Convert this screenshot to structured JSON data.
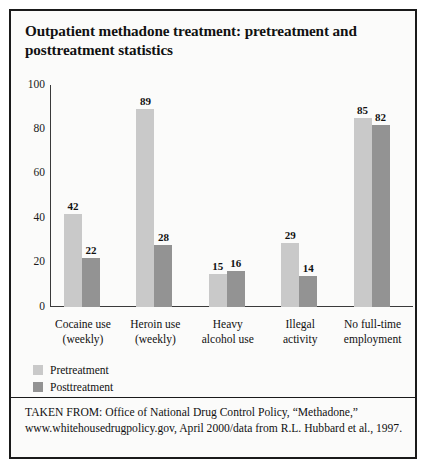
{
  "figure": {
    "title": "Outpatient methadone treatment: pretreatment and posttreatment statistics",
    "source": "TAKEN FROM: Office of National Drug Control Policy, “Methadone,” www.whitehousedrugpolicy.gov, April 2000/data from R.L. Hubbard et al., 1997."
  },
  "chart_data": {
    "type": "bar",
    "title": "Outpatient methadone treatment: pretreatment and posttreatment statistics",
    "xlabel": "",
    "ylabel": "",
    "ylim": [
      0,
      100
    ],
    "yticks": [
      "0",
      "20",
      "40",
      "60",
      "80",
      "100"
    ],
    "grid": false,
    "legend_position": "bottom-left",
    "categories": [
      "Cocaine use (weekly)",
      "Heroin use (weekly)",
      "Heavy alcohol use",
      "Illegal activity",
      "No full-time employment"
    ],
    "category_lines": [
      [
        "Cocaine use",
        "(weekly)"
      ],
      [
        "Heroin use",
        "(weekly)"
      ],
      [
        "Heavy",
        "alcohol use"
      ],
      [
        "Illegal",
        "activity"
      ],
      [
        "No full-time",
        "employment"
      ]
    ],
    "series": [
      {
        "name": "Pretreatment",
        "color": "#c9c9c9",
        "values": [
          42,
          89,
          15,
          29,
          85
        ]
      },
      {
        "name": "Posttreatment",
        "color": "#939393",
        "values": [
          22,
          28,
          16,
          14,
          82
        ]
      }
    ]
  }
}
